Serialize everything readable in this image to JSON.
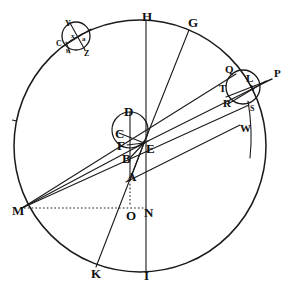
{
  "figure": {
    "kind": "geometric-astronomical-diagram",
    "title": "",
    "background_color": "#ffffff",
    "ink_color": "#1a1a1a",
    "width": 293,
    "height": 289
  },
  "circles": [
    {
      "name": "main-deferent-circle",
      "cx": 140,
      "cy": 146,
      "r": 126,
      "stroke_width": 1.4,
      "dashed": false
    },
    {
      "name": "central-small-circle",
      "cx": 130,
      "cy": 130,
      "r": 18,
      "stroke_width": 1.2,
      "dashed": false
    },
    {
      "name": "upper-left-epicycle",
      "cx": 76,
      "cy": 36,
      "r": 14,
      "stroke_width": 1.2,
      "dashed": false
    },
    {
      "name": "right-epicycle",
      "cx": 243,
      "cy": 87,
      "r": 17,
      "stroke_width": 1.2,
      "dashed": false
    }
  ],
  "lines": [
    {
      "name": "vertical-axis-H-I",
      "x1": 146,
      "y1": 20,
      "x2": 146,
      "y2": 272,
      "dashed": false
    },
    {
      "name": "line-E-to-G",
      "x1": 144,
      "y1": 143,
      "x2": 189,
      "y2": 30,
      "dashed": false
    },
    {
      "name": "line-E-to-K",
      "x1": 144,
      "y1": 143,
      "x2": 96,
      "y2": 267,
      "dashed": false
    },
    {
      "name": "line-E-to-P",
      "x1": 144,
      "y1": 143,
      "x2": 272,
      "y2": 79,
      "dashed": false
    },
    {
      "name": "line-M-to-Q",
      "x1": 22,
      "y1": 208,
      "x2": 236,
      "y2": 75,
      "dashed": false
    },
    {
      "name": "line-M-to-S",
      "x1": 22,
      "y1": 208,
      "x2": 248,
      "y2": 106,
      "dashed": false
    },
    {
      "name": "line-A-to-W",
      "x1": 130,
      "y1": 179,
      "x2": 243,
      "y2": 126,
      "dashed": false
    },
    {
      "name": "line-M-to-E-chord",
      "x1": 22,
      "y1": 208,
      "x2": 144,
      "y2": 143,
      "dashed": false
    },
    {
      "name": "line-D-to-B-vertical",
      "x1": 130,
      "y1": 112,
      "x2": 130,
      "y2": 179,
      "dashed": false
    },
    {
      "name": "line-C-to-E",
      "x1": 119,
      "y1": 133,
      "x2": 144,
      "y2": 143,
      "dashed": false
    },
    {
      "name": "line-F-to-E",
      "x1": 127,
      "y1": 144,
      "x2": 144,
      "y2": 143,
      "dashed": false
    },
    {
      "name": "line-S-arc-descender",
      "x1": 248,
      "y1": 104,
      "x2": 252,
      "y2": 150,
      "dashed": false
    },
    {
      "name": "dotted-M-to-N",
      "x1": 22,
      "y1": 208,
      "x2": 146,
      "y2": 208,
      "dashed": true
    },
    {
      "name": "dotted-A-to-O",
      "x1": 130,
      "y1": 180,
      "x2": 130,
      "y2": 208,
      "dashed": true
    }
  ],
  "epicycle_details": {
    "upper_left": {
      "chord_C_to_right": {
        "x1": 63,
        "y1": 46,
        "x2": 90,
        "y2": 30
      },
      "chord_Y_to_Z": {
        "x1": 69,
        "y1": 23,
        "x2": 86,
        "y2": 49
      },
      "tail_line": {
        "x1": 66,
        "y1": 41,
        "x2": 70,
        "y2": 52
      }
    },
    "right": {
      "chord_T_to_P": {
        "x1": 228,
        "y1": 96,
        "x2": 272,
        "y2": 79
      },
      "chord_R_to_Q_upper": {
        "x1": 229,
        "y1": 104,
        "x2": 264,
        "y2": 82
      }
    }
  },
  "labels": [
    {
      "name": "label-H",
      "text": "H",
      "x": 142,
      "y": 10,
      "size": "major"
    },
    {
      "name": "label-G",
      "text": "G",
      "x": 188,
      "y": 16,
      "size": "major"
    },
    {
      "name": "label-Y",
      "text": "Y",
      "x": 65,
      "y": 20,
      "size": "small"
    },
    {
      "name": "label-C-epicycle",
      "text": "C",
      "x": 56,
      "y": 40,
      "size": "small"
    },
    {
      "name": "label-Z",
      "text": "Z",
      "x": 84,
      "y": 50,
      "size": "small"
    },
    {
      "name": "label-epi-x",
      "text": "x",
      "x": 71,
      "y": 33,
      "size": "tiny"
    },
    {
      "name": "label-epi-a",
      "text": "a",
      "x": 82,
      "y": 36,
      "size": "tiny"
    },
    {
      "name": "label-epi-b",
      "text": "b",
      "x": 66,
      "y": 48,
      "size": "tiny"
    },
    {
      "name": "label-Q",
      "text": "Q",
      "x": 225,
      "y": 64,
      "size": "mid"
    },
    {
      "name": "label-P",
      "text": "P",
      "x": 274,
      "y": 68,
      "size": "mid"
    },
    {
      "name": "label-L",
      "text": "L",
      "x": 246,
      "y": 73,
      "size": "mid"
    },
    {
      "name": "label-V",
      "text": "V",
      "x": 250,
      "y": 85,
      "size": "small"
    },
    {
      "name": "label-T",
      "text": "T",
      "x": 219,
      "y": 83,
      "size": "mid"
    },
    {
      "name": "label-R",
      "text": "R",
      "x": 223,
      "y": 98,
      "size": "mid"
    },
    {
      "name": "label-S",
      "text": "S",
      "x": 250,
      "y": 105,
      "size": "small"
    },
    {
      "name": "label-W",
      "text": "W",
      "x": 240,
      "y": 123,
      "size": "mid"
    },
    {
      "name": "label-D",
      "text": "D",
      "x": 124,
      "y": 105,
      "size": "major"
    },
    {
      "name": "label-C-center",
      "text": "C",
      "x": 115,
      "y": 127,
      "size": "major"
    },
    {
      "name": "label-F",
      "text": "F",
      "x": 117,
      "y": 139,
      "size": "major"
    },
    {
      "name": "label-E",
      "text": "E",
      "x": 146,
      "y": 142,
      "size": "major"
    },
    {
      "name": "label-B",
      "text": "B",
      "x": 122,
      "y": 152,
      "size": "major"
    },
    {
      "name": "label-A",
      "text": "A",
      "x": 127,
      "y": 170,
      "size": "major"
    },
    {
      "name": "label-M",
      "text": "M",
      "x": 12,
      "y": 204,
      "size": "major"
    },
    {
      "name": "label-O",
      "text": "O",
      "x": 126,
      "y": 209,
      "size": "major"
    },
    {
      "name": "label-N",
      "text": "N",
      "x": 144,
      "y": 206,
      "size": "major"
    },
    {
      "name": "label-K",
      "text": "K",
      "x": 91,
      "y": 267,
      "size": "major"
    },
    {
      "name": "label-I",
      "text": "I",
      "x": 144,
      "y": 269,
      "size": "major"
    }
  ]
}
